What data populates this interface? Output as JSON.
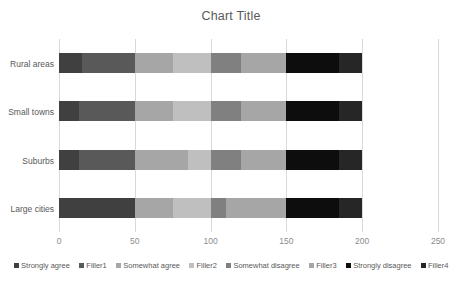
{
  "chart_data": {
    "type": "bar",
    "orientation": "horizontal",
    "stacked": true,
    "title": "Chart Title",
    "xlabel": "",
    "ylabel": "",
    "xlim": [
      0,
      250
    ],
    "xticks": [
      0,
      50,
      100,
      150,
      200,
      250
    ],
    "grid": true,
    "legend_position": "bottom",
    "categories": [
      "Rural areas",
      "Small towns",
      "Suburbs",
      "Large cities"
    ],
    "series": [
      {
        "name": "Strongly agree",
        "color": "#404040",
        "values": [
          15,
          13,
          13,
          50
        ]
      },
      {
        "name": "Filler1",
        "color": "#595959",
        "values": [
          35,
          37,
          37,
          0
        ]
      },
      {
        "name": "Somewhat agree",
        "color": "#a6a6a6",
        "values": [
          25,
          25,
          35,
          25
        ]
      },
      {
        "name": "Filler2",
        "color": "#bfbfbf",
        "values": [
          25,
          25,
          15,
          25
        ]
      },
      {
        "name": "Somewhat disagree",
        "color": "#808080",
        "values": [
          20,
          20,
          20,
          10
        ]
      },
      {
        "name": "Filler3",
        "color": "#a6a6a6",
        "values": [
          30,
          30,
          30,
          40
        ]
      },
      {
        "name": "Strongly disagree",
        "color": "#0d0d0d",
        "values": [
          35,
          35,
          35,
          35
        ]
      },
      {
        "name": "Filler4",
        "color": "#262626",
        "values": [
          15,
          15,
          15,
          15
        ]
      }
    ],
    "bar_total": 200
  },
  "legend": {
    "items": [
      {
        "label": "Strongly agree",
        "color": "#404040"
      },
      {
        "label": "Filler1",
        "color": "#595959"
      },
      {
        "label": "Somewhat agree",
        "color": "#a6a6a6"
      },
      {
        "label": "Filler2",
        "color": "#bfbfbf"
      },
      {
        "label": "Somewhat disagree",
        "color": "#808080"
      },
      {
        "label": "Filler3",
        "color": "#a6a6a6"
      },
      {
        "label": "Strongly disagree",
        "color": "#0d0d0d"
      },
      {
        "label": "Filler4",
        "color": "#262626"
      }
    ]
  },
  "colors": {
    "gridline": "#d9d9d9",
    "title_text": "#595959",
    "axis_text": "#8c8c8c",
    "category_text": "#595959",
    "background": "#ffffff"
  }
}
